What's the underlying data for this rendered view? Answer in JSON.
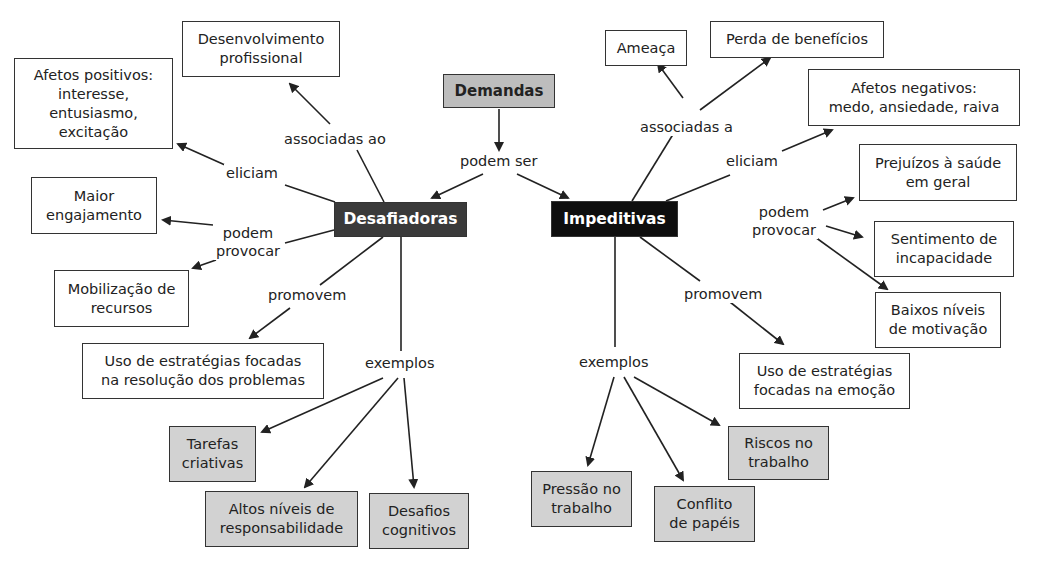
{
  "diagram": {
    "type": "concept-map",
    "root": {
      "label": "Demandas"
    },
    "root_link": "podem ser",
    "branches": {
      "desafiadoras": {
        "label": "Desafiadoras",
        "links": {
          "associadas_ao": "associadas ao",
          "eliciam": "eliciam",
          "podem_provocar": "podem\nprovocar",
          "promovem": "promovem",
          "exemplos": "exemplos"
        },
        "targets": {
          "desenvolvimento": "Desenvolvimento\nprofissional",
          "afetos_positivos": "Afetos positivos:\ninteresse,\nentusiasmo,\nexcitação",
          "maior_engajamento": "Maior\nengajamento",
          "mobilizacao": "Mobilização de\nrecursos",
          "estrategias_problemas": "Uso de estratégias focadas\nna resolução dos problemas",
          "examples": [
            "Tarefas\ncriativas",
            "Altos níveis de\nresponsabilidade",
            "Desafios\ncognitivos"
          ]
        }
      },
      "impeditivas": {
        "label": "Impeditivas",
        "links": {
          "associadas_a": "associadas a",
          "eliciam": "eliciam",
          "podem_provocar": "podem\nprovocar",
          "promovem": "promovem",
          "exemplos": "exemplos"
        },
        "targets": {
          "ameaca": "Ameaça",
          "perda_beneficios": "Perda de benefícios",
          "afetos_negativos": "Afetos negativos:\nmedo, ansiedade, raiva",
          "prejuizos_saude": "Prejuízos à saúde\nem geral",
          "sentimento_incapacidade": "Sentimento de\nincapacidade",
          "baixos_niveis": "Baixos níveis\nde motivação",
          "estrategias_emocao": "Uso de estratégias\nfocadas na emoção",
          "examples": [
            "Pressão no\ntrabalho",
            "Conflito\nde papéis",
            "Riscos no\ntrabalho"
          ]
        }
      }
    },
    "colors": {
      "root_fill": "#bdbdbd",
      "desafiadoras_fill": "#3a3a3a",
      "impeditivas_fill": "#0e0e0e",
      "example_fill": "#d2d2d2",
      "line": "#222222"
    }
  }
}
